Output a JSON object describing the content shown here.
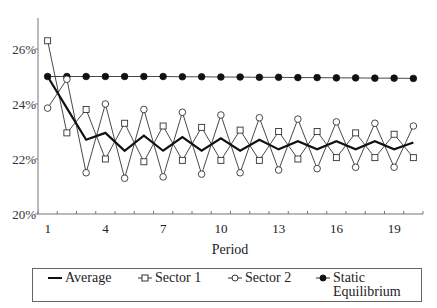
{
  "chart_data": {
    "type": "line",
    "title": "",
    "xlabel": "Period",
    "ylabel": "",
    "x": [
      1,
      2,
      3,
      4,
      5,
      6,
      7,
      8,
      9,
      10,
      11,
      12,
      13,
      14,
      15,
      16,
      17,
      18,
      19,
      20
    ],
    "xtick_labels": [
      "1",
      "4",
      "7",
      "10",
      "13",
      "16",
      "19"
    ],
    "xtick_positions": [
      1,
      4,
      7,
      10,
      13,
      16,
      19
    ],
    "ytick_labels": [
      "20%",
      "22%",
      "24%",
      "26%"
    ],
    "ytick_values": [
      20,
      22,
      24,
      26
    ],
    "ylim": [
      20,
      26.9
    ],
    "grid": false,
    "legend_position": "bottom",
    "series": [
      {
        "name": "Average",
        "marker": "none",
        "style": "thick-line",
        "values": [
          25.0,
          23.85,
          22.7,
          22.95,
          22.3,
          22.85,
          22.3,
          22.8,
          22.3,
          22.75,
          22.3,
          22.7,
          22.35,
          22.65,
          22.35,
          22.65,
          22.35,
          22.65,
          22.35,
          22.6
        ]
      },
      {
        "name": "Sector 1",
        "marker": "open-square",
        "style": "thin-line",
        "values": [
          26.3,
          22.95,
          23.8,
          22.0,
          23.3,
          21.9,
          23.2,
          21.95,
          23.15,
          21.95,
          23.05,
          21.95,
          23.0,
          22.0,
          23.0,
          22.05,
          22.95,
          22.05,
          22.9,
          22.05
        ]
      },
      {
        "name": "Sector 2",
        "marker": "open-circle",
        "style": "thin-line",
        "values": [
          23.85,
          24.9,
          21.5,
          24.0,
          21.3,
          23.8,
          21.35,
          23.7,
          21.45,
          23.6,
          21.5,
          23.5,
          21.6,
          23.45,
          21.65,
          23.35,
          21.7,
          23.3,
          21.7,
          23.2
        ]
      },
      {
        "name": "Static\nEquilibrium",
        "marker": "filled-circle",
        "style": "thin-line",
        "values": [
          25.0,
          25.0,
          25.0,
          25.0,
          25.0,
          25.0,
          25.0,
          24.99,
          24.99,
          24.98,
          24.98,
          24.97,
          24.97,
          24.96,
          24.96,
          24.95,
          24.95,
          24.94,
          24.94,
          24.93
        ]
      }
    ]
  },
  "legend": {
    "items": [
      {
        "label": "Average"
      },
      {
        "label": "Sector 1"
      },
      {
        "label": "Sector 2"
      },
      {
        "label": "Static\nEquilibrium"
      }
    ]
  }
}
